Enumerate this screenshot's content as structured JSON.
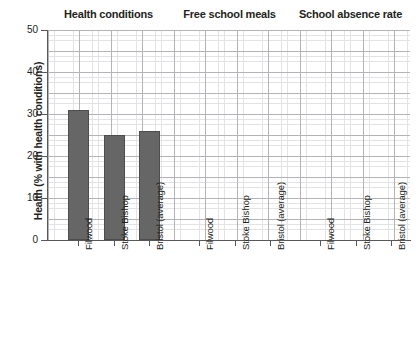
{
  "chart_data": {
    "type": "bar",
    "title": "",
    "panels": [
      {
        "title": "Health conditions",
        "categories": [
          "Filwood",
          "Stoke Bishop",
          "Bristol (average)"
        ],
        "values": [
          31,
          25,
          26
        ]
      },
      {
        "title": "Free school meals",
        "categories": [
          "Filwood",
          "Stoke Bishop",
          "Bristol (average)"
        ],
        "values": [
          null,
          null,
          null
        ]
      },
      {
        "title": "School absence rate",
        "categories": [
          "Filwood",
          "Stoke Bishop",
          "Bristol (average)"
        ],
        "values": [
          null,
          null,
          null
        ]
      }
    ],
    "ylabel": "Health (% with health conditions)",
    "xlabel": "",
    "ylim": [
      0,
      50
    ],
    "yticks": [
      0,
      10,
      20,
      30,
      40,
      50
    ],
    "ytick_labels": [
      "0",
      "10",
      "20",
      "30",
      "40",
      "50"
    ],
    "grid": true,
    "legend": false,
    "bar_color": "#666666",
    "grid_color": "#b4b4b8",
    "minor_grid_color": "#e3e3e6",
    "axis_color": "#58585b",
    "text_color": "#231f20"
  },
  "axis": {
    "y_title": "Health (% with health conditions)",
    "tick_labels": [
      "50",
      "40",
      "30",
      "20",
      "10",
      "0"
    ]
  },
  "panels": {
    "p0_title": "Health conditions",
    "p1_title": "Free school meals",
    "p2_title": "School absence rate"
  },
  "categories": {
    "c0": "Filwood",
    "c1": "Stoke Bishop",
    "c2": "Bristol (average)"
  }
}
